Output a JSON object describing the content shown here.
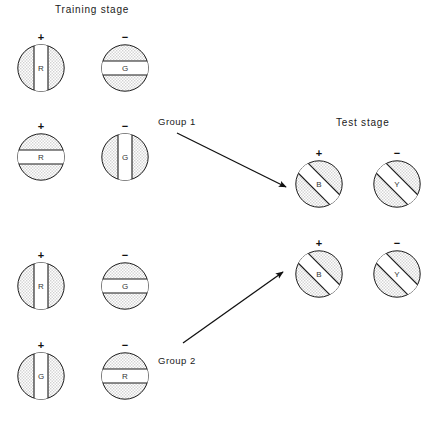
{
  "figure": {
    "width": 444,
    "height": 422,
    "background": "#ffffff",
    "ink_color": "#1a1a1a",
    "fill_texture_color": "#e9e9e9",
    "stripe_color": "#ffffff"
  },
  "titles": {
    "training": "Training stage",
    "test": "Test stage"
  },
  "signs": {
    "positive": "+",
    "negative": "−"
  },
  "cues": {
    "red": "R",
    "green": "G",
    "blue": "B",
    "yellow": "Y"
  },
  "groups": [
    {
      "id": "group-1",
      "label": "Group 1"
    },
    {
      "id": "group-2",
      "label": "Group 2"
    }
  ],
  "training_stage": {
    "title": "Training stage",
    "group1": {
      "rows": [
        {
          "positive": {
            "sign": "+",
            "letter": "R",
            "orientation": "vertical"
          },
          "negative": {
            "sign": "−",
            "letter": "G",
            "orientation": "horizontal"
          }
        },
        {
          "positive": {
            "sign": "+",
            "letter": "R",
            "orientation": "horizontal"
          },
          "negative": {
            "sign": "−",
            "letter": "G",
            "orientation": "vertical"
          }
        }
      ]
    },
    "group2": {
      "rows": [
        {
          "positive": {
            "sign": "+",
            "letter": "R",
            "orientation": "vertical"
          },
          "negative": {
            "sign": "−",
            "letter": "G",
            "orientation": "horizontal"
          }
        },
        {
          "positive": {
            "sign": "+",
            "letter": "G",
            "orientation": "vertical"
          },
          "negative": {
            "sign": "−",
            "letter": "R",
            "orientation": "horizontal"
          }
        }
      ]
    }
  },
  "test_stage": {
    "title": "Test stage",
    "rows": [
      {
        "positive": {
          "sign": "+",
          "letter": "B",
          "orientation": "diagonal"
        },
        "negative": {
          "sign": "−",
          "letter": "Y",
          "orientation": "diagonal"
        }
      },
      {
        "positive": {
          "sign": "+",
          "letter": "B",
          "orientation": "diagonal"
        },
        "negative": {
          "sign": "−",
          "letter": "Y",
          "orientation": "diagonal"
        }
      }
    ]
  },
  "arrows": [
    {
      "name": "group-1-arrow",
      "direction": "down-right",
      "from_label": "Group 1"
    },
    {
      "name": "group-2-arrow",
      "direction": "up-right",
      "from_label": "Group 2"
    }
  ]
}
